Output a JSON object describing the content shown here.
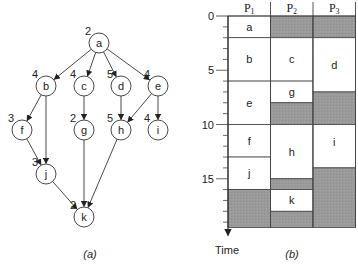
{
  "diagram_a": {
    "caption": "(a)",
    "nodes": [
      {
        "id": "a",
        "weight": "2",
        "x": 99,
        "y": 43
      },
      {
        "id": "b",
        "weight": "4",
        "x": 46,
        "y": 86
      },
      {
        "id": "c",
        "weight": "4",
        "x": 84,
        "y": 86
      },
      {
        "id": "d",
        "weight": "5",
        "x": 121,
        "y": 86
      },
      {
        "id": "e",
        "weight": "4",
        "x": 158,
        "y": 86
      },
      {
        "id": "f",
        "weight": "3",
        "x": 22,
        "y": 130
      },
      {
        "id": "g",
        "weight": "2",
        "x": 84,
        "y": 130
      },
      {
        "id": "h",
        "weight": "5",
        "x": 121,
        "y": 130
      },
      {
        "id": "i",
        "weight": "4",
        "x": 158,
        "y": 130
      },
      {
        "id": "j",
        "weight": "3",
        "x": 46,
        "y": 174
      },
      {
        "id": "k",
        "weight": "2",
        "x": 84,
        "y": 217
      }
    ],
    "edges": [
      [
        "a",
        "b"
      ],
      [
        "a",
        "c"
      ],
      [
        "a",
        "d"
      ],
      [
        "a",
        "e"
      ],
      [
        "b",
        "f"
      ],
      [
        "b",
        "j"
      ],
      [
        "c",
        "g"
      ],
      [
        "d",
        "h"
      ],
      [
        "e",
        "h"
      ],
      [
        "e",
        "i"
      ],
      [
        "f",
        "j"
      ],
      [
        "j",
        "k"
      ],
      [
        "g",
        "k"
      ],
      [
        "h",
        "k"
      ]
    ]
  },
  "diagram_b": {
    "caption": "(b)",
    "axis_label": "Time",
    "ticks": [
      "0",
      "5",
      "10",
      "15"
    ],
    "processors": [
      {
        "name": "P",
        "sub": "1"
      },
      {
        "name": "P",
        "sub": "2"
      },
      {
        "name": "P",
        "sub": "3"
      }
    ],
    "schedule": [
      [
        {
          "task": "a",
          "start": 0,
          "end": 2
        },
        {
          "task": "b",
          "start": 2,
          "end": 6
        },
        {
          "task": "e",
          "start": 6,
          "end": 10
        },
        {
          "task": "f",
          "start": 10,
          "end": 13
        },
        {
          "task": "j",
          "start": 13,
          "end": 16
        },
        {
          "task": "",
          "start": 16,
          "end": 19.5,
          "idle": true
        }
      ],
      [
        {
          "task": "",
          "start": 0,
          "end": 2,
          "idle": true
        },
        {
          "task": "c",
          "start": 2,
          "end": 6
        },
        {
          "task": "g",
          "start": 6,
          "end": 8
        },
        {
          "task": "",
          "start": 8,
          "end": 10,
          "idle": true
        },
        {
          "task": "h",
          "start": 10,
          "end": 15
        },
        {
          "task": "",
          "start": 15,
          "end": 16,
          "idle": true
        },
        {
          "task": "k",
          "start": 16,
          "end": 18
        },
        {
          "task": "",
          "start": 18,
          "end": 19.5,
          "idle": true
        }
      ],
      [
        {
          "task": "",
          "start": 0,
          "end": 2,
          "idle": true
        },
        {
          "task": "d",
          "start": 2,
          "end": 7
        },
        {
          "task": "",
          "start": 7,
          "end": 10,
          "idle": true
        },
        {
          "task": "i",
          "start": 10,
          "end": 14
        },
        {
          "task": "",
          "start": 14,
          "end": 19.5,
          "idle": true
        }
      ]
    ],
    "colors": {
      "idle": "#9a9a9a",
      "task": "#ffffff",
      "line": "#444444"
    }
  }
}
